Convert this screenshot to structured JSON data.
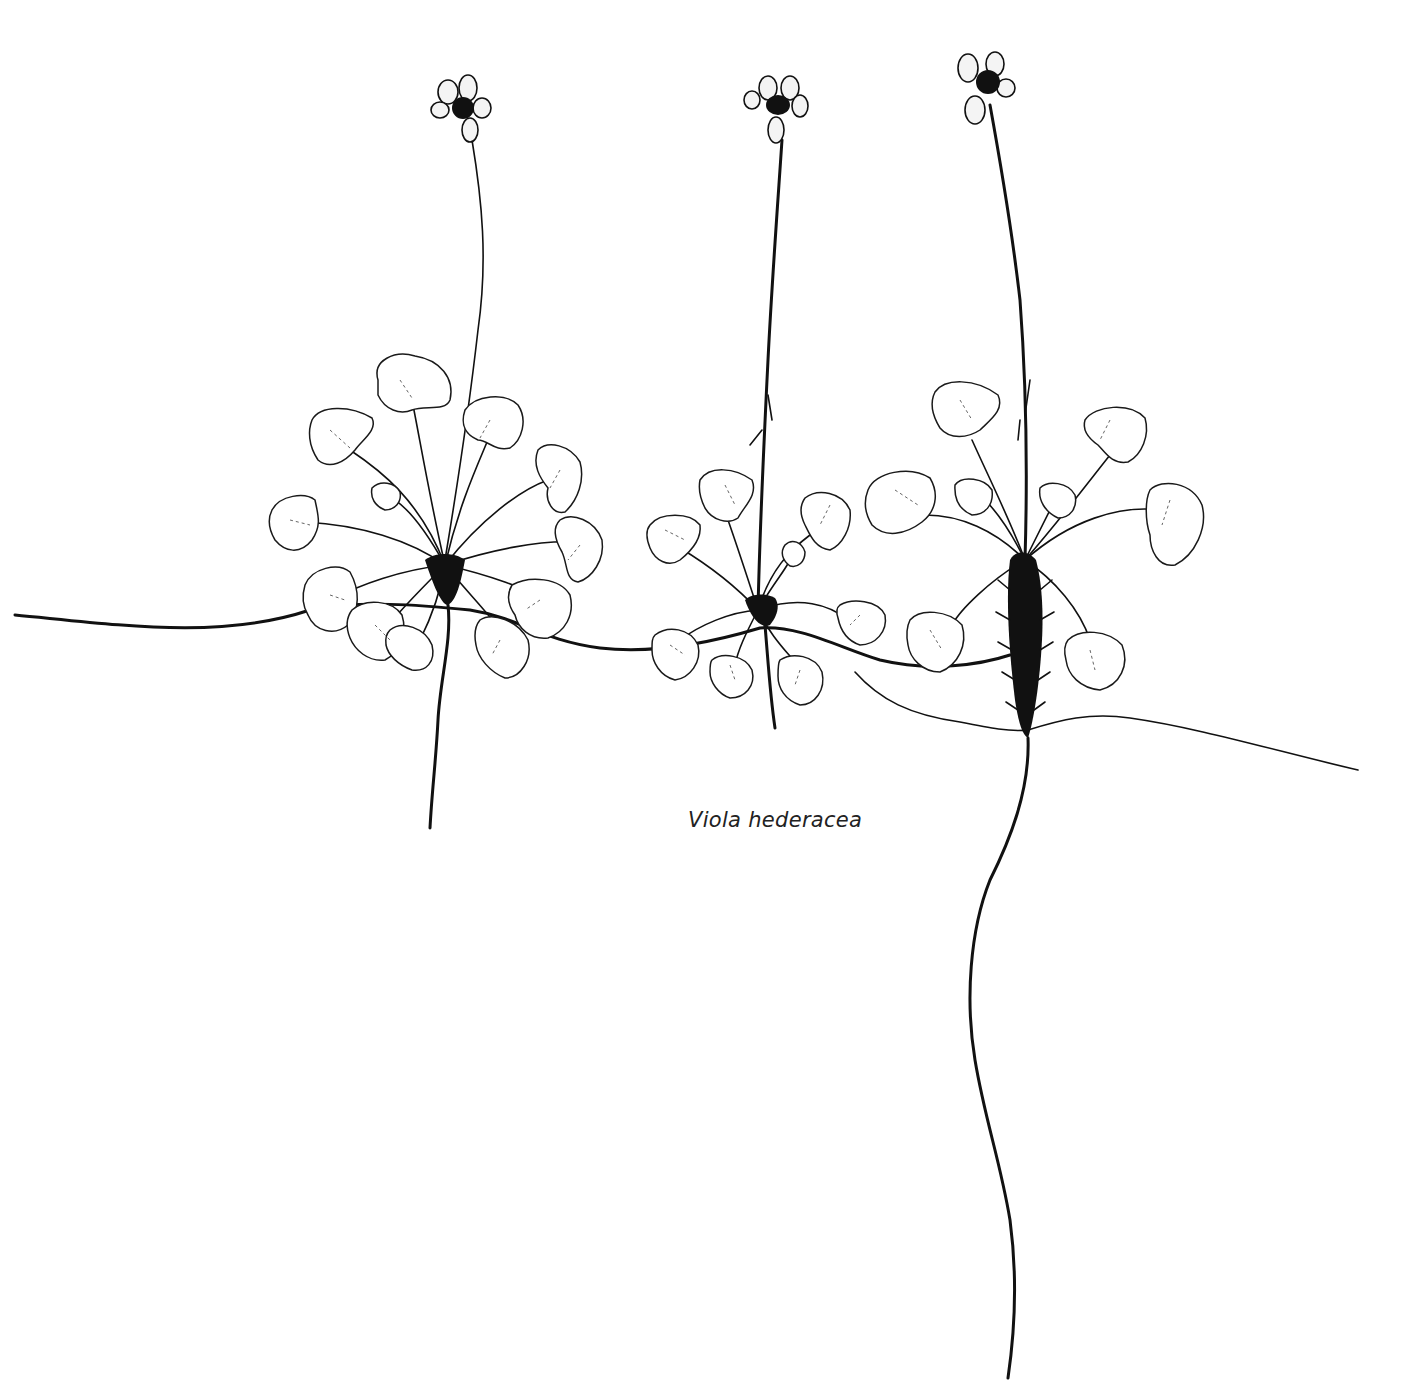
{
  "caption": "Viola hederacea",
  "illustration": {
    "style": "black ink botanical line drawing on white",
    "subject": "three rosettes of ivy-leaved violet joined by stolons, each with a single long-stalked flower",
    "plants": [
      {
        "label": "left plant",
        "flower": "flower-1",
        "rosette": "rosette-1"
      },
      {
        "label": "middle plant",
        "flower": "flower-2",
        "rosette": "rosette-2"
      },
      {
        "label": "right plant",
        "flower": "flower-3",
        "rosette": "rosette-3",
        "note": "hairy rootstock with long taproot"
      }
    ],
    "colors": {
      "ink": "#111111",
      "paper": "#ffffff"
    }
  }
}
